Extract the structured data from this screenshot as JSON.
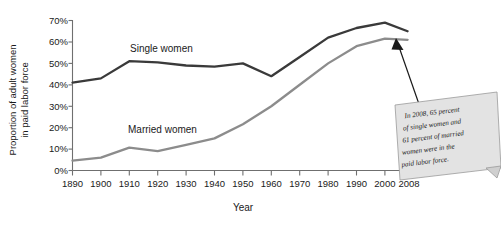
{
  "chart_data": {
    "type": "line",
    "title": "",
    "xlabel": "Year",
    "ylabel": "Proportion of adult women in paid labor force",
    "x": [
      1890,
      1900,
      1910,
      1920,
      1930,
      1940,
      1950,
      1960,
      1970,
      1980,
      1990,
      2000,
      2008
    ],
    "xtick_labels": [
      "1890",
      "1900",
      "1910",
      "1920",
      "1930",
      "1940",
      "1950",
      "1960",
      "1970",
      "1980",
      "1990",
      "2000",
      "2008"
    ],
    "ytick_labels": [
      "0%",
      "10%",
      "20%",
      "30%",
      "40%",
      "50%",
      "60%",
      "70%"
    ],
    "ytick_values": [
      0,
      10,
      20,
      30,
      40,
      50,
      60,
      70
    ],
    "ylim": [
      0,
      70
    ],
    "xlim": [
      1890,
      2008
    ],
    "grid": false,
    "legend_position": "inline-labels",
    "series": [
      {
        "name": "Single women",
        "color": "#3a3a3a",
        "values": [
          41,
          43,
          51,
          50.5,
          49,
          48.5,
          50,
          44,
          53,
          62,
          66.5,
          69,
          65
        ]
      },
      {
        "name": "Married women",
        "color": "#8c8c8c",
        "values": [
          4.6,
          6,
          10.7,
          9,
          12,
          15,
          21.6,
          30,
          40,
          50,
          58,
          61.5,
          61
        ]
      }
    ],
    "annotations": [
      {
        "name": "callout-2008",
        "text": "In 2008, 65 percent of single women and 61 percent of married women were in the paid labor force.",
        "lines": [
          "In 2008, 65 percent",
          "of single women and",
          "61 percent of married",
          "women were in the",
          "paid labor force."
        ],
        "points_to_year": 2008,
        "points_to_value": 61
      }
    ],
    "series_inline_labels": [
      {
        "text": "Single women",
        "x": 1930,
        "y": 57
      },
      {
        "text": "Married women",
        "x": 1928,
        "y": 25
      }
    ]
  },
  "colors": {
    "single_women": "#3a3a3a",
    "married_women": "#8c8c8c",
    "axis": "#6f6f6f",
    "callout_fill": "#e3e3e3",
    "callout_border": "#9a9a9a",
    "text": "#1a1a1a",
    "background": "#ffffff"
  }
}
